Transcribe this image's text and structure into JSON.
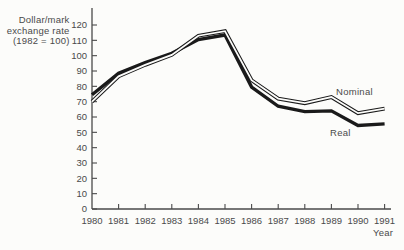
{
  "figure": {
    "background": "#fcfcfa"
  },
  "chart_data": {
    "type": "line",
    "title": "",
    "xlabel": "Year",
    "ylabel": "Dollar/mark exchange rate (1982 = 100)",
    "ylabel_lines": [
      "Dollar/mark",
      "exchange rate",
      "(1982 = 100)"
    ],
    "x": [
      1980,
      1981,
      1982,
      1983,
      1984,
      1985,
      1986,
      1987,
      1988,
      1989,
      1990,
      1991
    ],
    "x_tick_labels": [
      "1980",
      "1981",
      "1982",
      "1983",
      "1984",
      "1985",
      "1986",
      "1987",
      "1988",
      "1989",
      "1990",
      "1991"
    ],
    "y_ticks": [
      0,
      10,
      20,
      30,
      40,
      50,
      60,
      70,
      80,
      90,
      100,
      110,
      120
    ],
    "y_tick_labels": [
      "0",
      "10",
      "20",
      "30",
      "40",
      "50",
      "60",
      "70",
      "80",
      "90",
      "100",
      "110",
      "120"
    ],
    "ylim": [
      0,
      120
    ],
    "grid": false,
    "legend_position": "inline-annotations",
    "series": [
      {
        "name": "Nominal",
        "style": "hollow-double-line",
        "color": "#1a1a1a",
        "values": [
          70,
          86.5,
          94,
          100.5,
          113,
          116,
          84,
          72,
          69,
          73,
          62.5,
          65.5
        ]
      },
      {
        "name": "Real",
        "style": "thick-solid-line",
        "color": "#1a1a1a",
        "values": [
          74.5,
          88.5,
          95.5,
          101.5,
          110.5,
          113.5,
          79.5,
          67,
          63.5,
          64,
          54.5,
          55.5
        ]
      }
    ],
    "annotations": [
      {
        "text": "Nominal",
        "attached_to": "Nominal"
      },
      {
        "text": "Real",
        "attached_to": "Real"
      }
    ]
  },
  "colors": {
    "background": "#fcfcfa",
    "axis": "#4a4a4a",
    "text": "#4a4a4a",
    "line": "#1a1a1a",
    "line_core": "#fcfcfa"
  }
}
